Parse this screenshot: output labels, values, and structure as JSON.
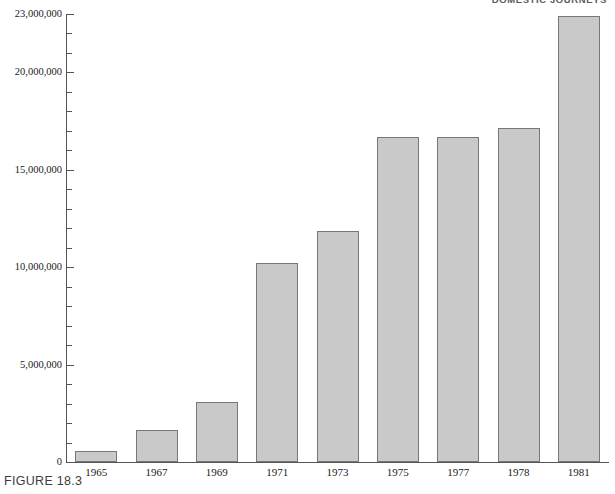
{
  "header": {
    "label": "DOMESTIC JOURNEYS"
  },
  "caption": {
    "text": "FIGURE 18.3"
  },
  "colors": {
    "bar_fill": "#c9c9c9",
    "bar_stroke": "#777777",
    "axis": "#555555",
    "text": "#1a1a1a",
    "caption_text": "#3d3d3d"
  },
  "chart_data": {
    "type": "bar",
    "title": "",
    "subtitle": "",
    "xlabel": "",
    "ylabel": "",
    "categories": [
      "1965",
      "1967",
      "1969",
      "1971",
      "1973",
      "1975",
      "1977",
      "1978",
      "1981"
    ],
    "values": [
      550000,
      1650000,
      3100000,
      10200000,
      11850000,
      16700000,
      16700000,
      17150000,
      22900000
    ],
    "ylim": [
      0,
      23000000
    ],
    "ytick_labels": [
      "0",
      "5,000,000",
      "10,000,000",
      "15,000,000",
      "20,000,000",
      "23,000,000"
    ],
    "ytick_values": [
      0,
      5000000,
      10000000,
      15000000,
      20000000,
      23000000
    ],
    "yminor_step": 1000000,
    "grid": false,
    "legend": null,
    "annotations": []
  }
}
